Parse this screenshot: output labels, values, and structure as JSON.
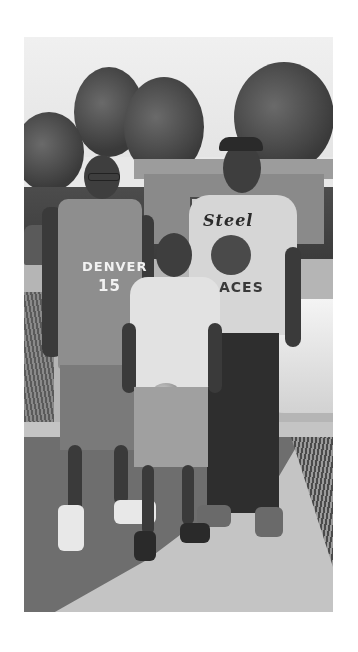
{
  "image": {
    "description": "Grayscale photograph of three people standing on a sidewalk in front of trees, a house, and parked cars",
    "style": "black-and-white",
    "margin_color": "#ffffff",
    "photo_bounds": {
      "left": 24,
      "top": 37,
      "width": 309,
      "height": 575
    }
  },
  "subjects": {
    "left_man": {
      "jersey_text": "DENVER",
      "jersey_number": "15",
      "accessories": "glasses"
    },
    "center_child": {
      "holding": "football"
    },
    "right_man": {
      "shirt_text_top": "Steel",
      "shirt_text_bottom": "ACES",
      "accessories": "cap"
    }
  },
  "colors": {
    "sky": "#ececec",
    "trees": "#444444",
    "road": "#b5b5b5",
    "sidewalk": "#c4c4c4",
    "shadow": "#6e6e6e"
  }
}
